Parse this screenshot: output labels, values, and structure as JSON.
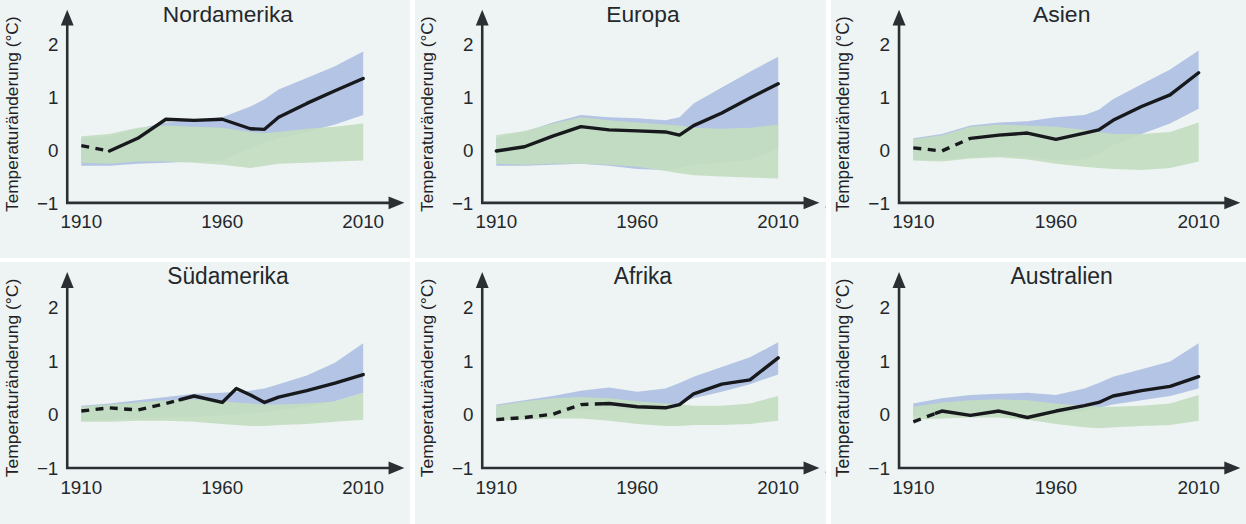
{
  "figure": {
    "background_color": "#eef4f3",
    "grid": {
      "columns": 3,
      "rows": 2
    }
  },
  "axes": {
    "y_title": "Temperaturänderung (°C)",
    "x_title": "Jahr",
    "x_ticks": [
      "1910",
      "1960",
      "2010"
    ],
    "y_ticks": [
      "2",
      "1",
      "0",
      "−1"
    ],
    "x_tick_values": [
      1910,
      1960,
      2010
    ],
    "y_tick_values": [
      2,
      1,
      0,
      -1
    ],
    "xlim": [
      1905,
      2012
    ],
    "ylim": [
      -1,
      2.35
    ]
  },
  "series_colors": {
    "observed": "#17191c",
    "models_natural_and_anthropogenic": "#aebfe3",
    "models_natural_only": "#c3dcc0"
  },
  "chart_data": [
    {
      "type": "line",
      "title": "Nordamerika",
      "xlabel": "Jahr",
      "ylabel": "Temperaturänderung (°C)",
      "xlim": [
        1905,
        2012
      ],
      "ylim": [
        -1,
        2.35
      ],
      "grid": false,
      "legend": "none",
      "x": [
        1910,
        1920,
        1930,
        1940,
        1950,
        1960,
        1970,
        1975,
        1980,
        1990,
        2000,
        2010
      ],
      "observed": [
        0.08,
        -0.02,
        0.22,
        0.58,
        0.56,
        0.58,
        0.4,
        0.39,
        0.62,
        0.88,
        1.12,
        1.35
      ],
      "observed_dashed_until": 1920,
      "band_blue_lower": [
        -0.3,
        -0.3,
        -0.26,
        -0.24,
        -0.22,
        -0.2,
        0.04,
        0.14,
        0.22,
        0.34,
        0.48,
        0.66
      ],
      "band_blue_upper": [
        0.22,
        0.26,
        0.4,
        0.52,
        0.56,
        0.62,
        0.82,
        0.96,
        1.14,
        1.36,
        1.58,
        1.86
      ],
      "band_green_lower": [
        -0.24,
        -0.26,
        -0.22,
        -0.22,
        -0.24,
        -0.28,
        -0.34,
        -0.3,
        -0.26,
        -0.24,
        -0.22,
        -0.2
      ],
      "band_green_upper": [
        0.26,
        0.3,
        0.42,
        0.46,
        0.44,
        0.42,
        0.34,
        0.32,
        0.34,
        0.4,
        0.44,
        0.5
      ]
    },
    {
      "type": "line",
      "title": "Europa",
      "xlabel": "Jahr",
      "ylabel": "Temperaturänderung (°C)",
      "xlim": [
        1905,
        2012
      ],
      "ylim": [
        -1,
        2.35
      ],
      "grid": false,
      "legend": "none",
      "x": [
        1910,
        1920,
        1930,
        1940,
        1950,
        1960,
        1970,
        1975,
        1980,
        1990,
        2000,
        2010
      ],
      "observed": [
        -0.02,
        0.06,
        0.26,
        0.44,
        0.38,
        0.36,
        0.34,
        0.28,
        0.46,
        0.7,
        0.98,
        1.25
      ],
      "observed_dashed_until": 1910,
      "band_blue_lower": [
        -0.3,
        -0.3,
        -0.28,
        -0.26,
        -0.3,
        -0.36,
        -0.38,
        -0.34,
        -0.28,
        -0.24,
        -0.18,
        0.02
      ],
      "band_blue_upper": [
        0.24,
        0.34,
        0.52,
        0.66,
        0.62,
        0.6,
        0.56,
        0.62,
        0.88,
        1.18,
        1.48,
        1.76
      ],
      "band_green_lower": [
        -0.26,
        -0.28,
        -0.26,
        -0.26,
        -0.28,
        -0.32,
        -0.4,
        -0.44,
        -0.48,
        -0.5,
        -0.52,
        -0.54
      ],
      "band_green_upper": [
        0.28,
        0.36,
        0.5,
        0.62,
        0.56,
        0.52,
        0.48,
        0.46,
        0.42,
        0.4,
        0.42,
        0.48
      ]
    },
    {
      "type": "line",
      "title": "Asien",
      "xlabel": "Jahr",
      "ylabel": "Temperaturänderung (°C)",
      "xlim": [
        1905,
        2012
      ],
      "ylim": [
        -1,
        2.35
      ],
      "grid": false,
      "legend": "none",
      "x": [
        1910,
        1920,
        1930,
        1940,
        1950,
        1960,
        1970,
        1975,
        1980,
        1990,
        2000,
        2010
      ],
      "observed": [
        0.04,
        -0.02,
        0.22,
        0.28,
        0.32,
        0.2,
        0.32,
        0.38,
        0.56,
        0.82,
        1.04,
        1.46
      ],
      "observed_dashed_until": 1930,
      "band_blue_lower": [
        -0.18,
        -0.18,
        -0.14,
        -0.12,
        -0.12,
        -0.2,
        -0.18,
        -0.06,
        0.1,
        0.3,
        0.5,
        0.78
      ],
      "band_blue_upper": [
        0.22,
        0.3,
        0.46,
        0.52,
        0.54,
        0.62,
        0.66,
        0.76,
        0.96,
        1.24,
        1.52,
        1.88
      ],
      "band_green_lower": [
        -0.2,
        -0.22,
        -0.16,
        -0.14,
        -0.18,
        -0.26,
        -0.32,
        -0.34,
        -0.36,
        -0.38,
        -0.34,
        -0.22
      ],
      "band_green_upper": [
        0.2,
        0.28,
        0.44,
        0.48,
        0.46,
        0.44,
        0.38,
        0.34,
        0.3,
        0.3,
        0.34,
        0.52
      ]
    },
    {
      "type": "line",
      "title": "Südamerika",
      "xlabel": "Jahr",
      "ylabel": "Temperaturänderung (°C)",
      "xlim": [
        1905,
        2012
      ],
      "ylim": [
        -1,
        2.35
      ],
      "grid": false,
      "legend": "none",
      "x": [
        1910,
        1920,
        1930,
        1940,
        1950,
        1960,
        1965,
        1970,
        1975,
        1980,
        1990,
        2000,
        2010
      ],
      "observed": [
        0.06,
        0.12,
        0.08,
        0.2,
        0.34,
        0.22,
        0.48,
        0.36,
        0.22,
        0.32,
        0.44,
        0.58,
        0.74
      ],
      "observed_dashed_until": 1945,
      "band_blue_lower": [
        -0.12,
        -0.1,
        -0.08,
        -0.06,
        -0.04,
        -0.02,
        0.0,
        0.02,
        0.04,
        0.08,
        0.14,
        0.24,
        0.4
      ],
      "band_blue_upper": [
        0.16,
        0.2,
        0.26,
        0.32,
        0.38,
        0.4,
        0.42,
        0.44,
        0.48,
        0.56,
        0.72,
        0.96,
        1.32
      ],
      "band_green_lower": [
        -0.14,
        -0.14,
        -0.12,
        -0.12,
        -0.14,
        -0.18,
        -0.2,
        -0.22,
        -0.22,
        -0.2,
        -0.18,
        -0.14,
        -0.1
      ],
      "band_green_upper": [
        0.14,
        0.18,
        0.22,
        0.26,
        0.28,
        0.24,
        0.22,
        0.2,
        0.18,
        0.18,
        0.2,
        0.24,
        0.4
      ]
    },
    {
      "type": "line",
      "title": "Afrika",
      "xlabel": "Jahr",
      "ylabel": "Temperaturänderung (°C)",
      "xlim": [
        1905,
        2012
      ],
      "ylim": [
        -1,
        2.35
      ],
      "grid": false,
      "legend": "none",
      "x": [
        1910,
        1920,
        1930,
        1940,
        1950,
        1960,
        1970,
        1975,
        1980,
        1990,
        2000,
        2010
      ],
      "observed": [
        -0.1,
        -0.06,
        0.0,
        0.18,
        0.2,
        0.14,
        0.12,
        0.18,
        0.38,
        0.56,
        0.64,
        1.05
      ],
      "observed_dashed_until": 1948,
      "band_blue_lower": [
        -0.1,
        -0.06,
        0.0,
        0.06,
        0.1,
        0.08,
        0.12,
        0.2,
        0.3,
        0.42,
        0.56,
        0.74
      ],
      "band_blue_upper": [
        0.18,
        0.26,
        0.34,
        0.44,
        0.5,
        0.42,
        0.48,
        0.58,
        0.7,
        0.88,
        1.06,
        1.34
      ],
      "band_green_lower": [
        -0.12,
        -0.1,
        -0.08,
        -0.08,
        -0.12,
        -0.18,
        -0.22,
        -0.22,
        -0.2,
        -0.2,
        -0.18,
        -0.12
      ],
      "band_green_upper": [
        0.16,
        0.24,
        0.3,
        0.32,
        0.3,
        0.24,
        0.2,
        0.18,
        0.16,
        0.16,
        0.2,
        0.34
      ]
    },
    {
      "type": "line",
      "title": "Australien",
      "xlabel": "Jahr",
      "ylabel": "Temperaturänderung (°C)",
      "xlim": [
        1905,
        2012
      ],
      "ylim": [
        -1,
        2.35
      ],
      "grid": false,
      "legend": "none",
      "x": [
        1910,
        1920,
        1930,
        1940,
        1950,
        1960,
        1970,
        1975,
        1980,
        1990,
        2000,
        2010
      ],
      "observed": [
        -0.14,
        0.06,
        -0.02,
        0.06,
        -0.06,
        0.06,
        0.16,
        0.22,
        0.34,
        0.44,
        0.52,
        0.7
      ],
      "observed_dashed_until": 1918,
      "band_blue_lower": [
        -0.04,
        0.0,
        0.04,
        0.06,
        0.04,
        0.0,
        0.06,
        0.12,
        0.18,
        0.26,
        0.34,
        0.48
      ],
      "band_blue_upper": [
        0.2,
        0.3,
        0.36,
        0.38,
        0.4,
        0.36,
        0.48,
        0.58,
        0.7,
        0.84,
        0.98,
        1.32
      ],
      "band_green_lower": [
        -0.1,
        -0.08,
        -0.06,
        -0.06,
        -0.1,
        -0.18,
        -0.24,
        -0.26,
        -0.24,
        -0.22,
        -0.2,
        -0.12
      ],
      "band_green_upper": [
        0.14,
        0.22,
        0.26,
        0.28,
        0.26,
        0.2,
        0.16,
        0.14,
        0.14,
        0.16,
        0.2,
        0.36
      ]
    }
  ]
}
